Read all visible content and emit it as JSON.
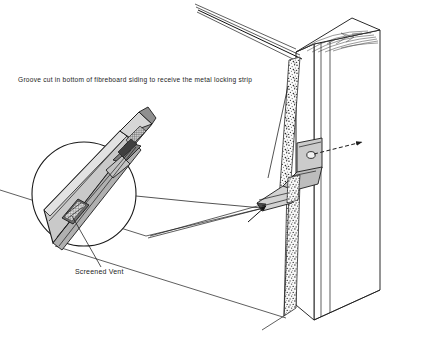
{
  "figure": {
    "width": 427,
    "height": 348,
    "background_color": "#ffffff",
    "line_color": "#1a1a1a"
  },
  "annotations": {
    "caption_main": "Groove cut in bottom of fibreboard siding to receive the metal locking strip",
    "label_vent": "Screened Vent"
  },
  "components": {
    "post": {
      "name": "wood post",
      "fill_color": "#ffffff",
      "edge_color": "#2a2a2a",
      "end_grain": "annual ring arcs on sawn top face"
    },
    "siding": {
      "name": "fibreboard siding panel",
      "face_color": "#ffffff",
      "edge_texture_color": "#5a5a5a",
      "edge_texture": "speckled stipple showing fibreboard core"
    },
    "locking_strip": {
      "name": "metal locking strip",
      "fill_color": "#c8c8c8",
      "shade_color": "#9a9a9a",
      "dark_color": "#4a4a4a",
      "profile": "z-folded sheet metal"
    },
    "vent": {
      "name": "screened vent",
      "mesh_color": "#555555",
      "shape": "louvered slot with wire screen"
    },
    "nail": {
      "name": "nail fastener",
      "style": "dashed centreline with arrowhead"
    },
    "detail_circle": {
      "name": "enlarged detail callout",
      "center_x": 84,
      "center_y": 194,
      "radius": 52,
      "stroke_color": "#1a1a1a"
    }
  }
}
